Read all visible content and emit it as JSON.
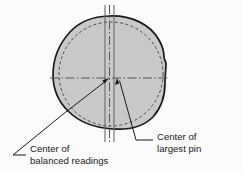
{
  "figure": {
    "background_color": "#fbfbfb",
    "shape_fill_color": "#c9c9c9",
    "outline_color": "#1a1a1a",
    "dashed_circle_color": "#4d4d4d",
    "centerline_color": "#555555",
    "leader_color": "#1a1a1a",
    "text_color": "#1a1a1a"
  },
  "labels": {
    "left": {
      "line1": "Center of",
      "line2": "balanced readings"
    },
    "right": {
      "line1": "Center of",
      "line2": "largest pin"
    }
  },
  "geometry": {
    "center_of_balanced_readings": {
      "x": 109,
      "y": 78
    },
    "center_of_largest_pin": {
      "x": 117,
      "y": 78
    },
    "blob_left_edge_x": 53,
    "blob_right_edge_x": 166,
    "blob_top_y": 16,
    "blob_bottom_y": 129,
    "dashed_circle_center": {
      "x": 111,
      "y": 74
    },
    "dashed_circle_radius": 52,
    "vertical_line_left_x": 105,
    "vertical_line_right_x": 114,
    "vertical_centerline_x": 109.5,
    "horizontal_centerline_y": 78
  }
}
